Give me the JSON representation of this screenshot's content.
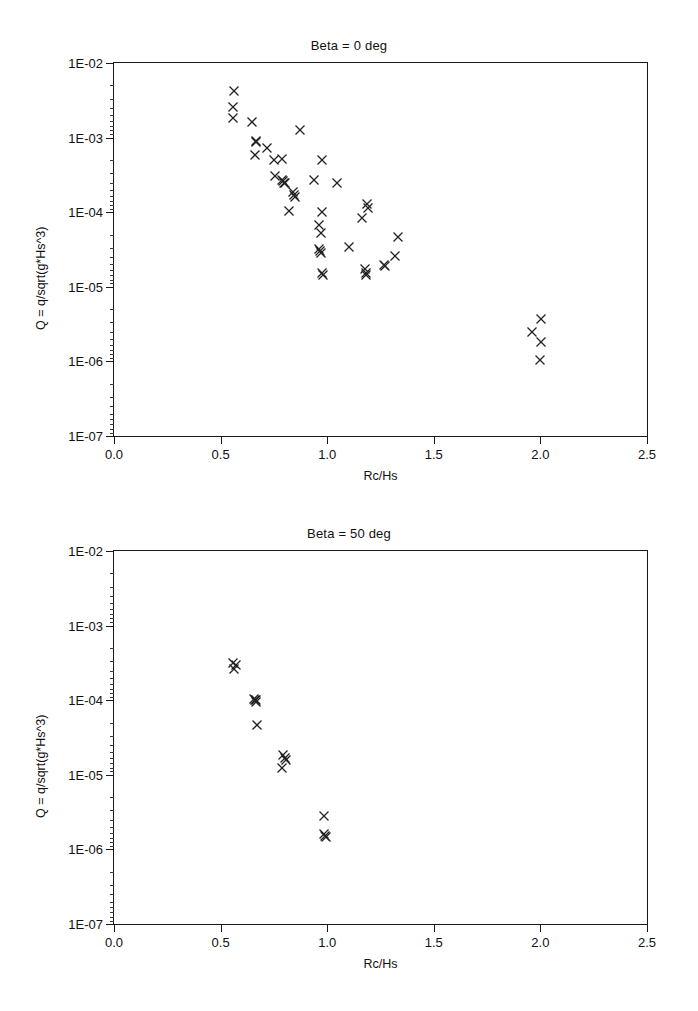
{
  "figures": [
    {
      "id": "beta-0",
      "title": "Beta = 0 deg",
      "xlabel": "Rc/Hs",
      "ylabel": "Q = q/sqrt(g*Hs^3)"
    },
    {
      "id": "beta-50",
      "title": "Beta = 50 deg",
      "xlabel": "Rc/Hs",
      "ylabel": "Q = q/sqrt(g*Hs^3)"
    }
  ],
  "axis": {
    "x_ticks": [
      "0.0",
      "0.5",
      "1.0",
      "1.5",
      "2.0",
      "2.5"
    ],
    "x_tick_values": [
      0.0,
      0.5,
      1.0,
      1.5,
      2.0,
      2.5
    ],
    "y_ticks": [
      "1E-02",
      "1E-03",
      "1E-04",
      "1E-05",
      "1E-06",
      "1E-07"
    ],
    "y_tick_values": [
      0.01,
      0.001,
      0.0001,
      1e-05,
      1e-06,
      1e-07
    ],
    "xlim": [
      0.0,
      2.5
    ],
    "ylim": [
      1e-07,
      0.01
    ],
    "yscale": "log",
    "xscale": "linear",
    "grid": false
  },
  "colors": {
    "marker": "#222222",
    "axis": "#1a1a1a",
    "background": "#ffffff"
  },
  "chart_data": [
    {
      "type": "scatter",
      "title": "Beta = 0 deg",
      "xlabel": "Rc/Hs",
      "ylabel": "Q = q/sqrt(g*Hs^3)",
      "xlim": [
        0.0,
        2.5
      ],
      "ylim": [
        1e-07,
        0.01
      ],
      "yscale": "log",
      "grid": false,
      "legend": null,
      "marker": "x",
      "points": [
        {
          "x": 0.565,
          "y": 0.0042
        },
        {
          "x": 0.56,
          "y": 0.0026
        },
        {
          "x": 0.558,
          "y": 0.00185
        },
        {
          "x": 0.645,
          "y": 0.00162
        },
        {
          "x": 0.872,
          "y": 0.00125
        },
        {
          "x": 0.668,
          "y": 0.0009
        },
        {
          "x": 0.665,
          "y": 0.00086
        },
        {
          "x": 0.718,
          "y": 0.00073
        },
        {
          "x": 0.663,
          "y": 0.00058
        },
        {
          "x": 0.752,
          "y": 0.0005
        },
        {
          "x": 0.79,
          "y": 0.00051
        },
        {
          "x": 0.975,
          "y": 0.0005
        },
        {
          "x": 0.757,
          "y": 0.00031
        },
        {
          "x": 0.788,
          "y": 0.00027
        },
        {
          "x": 0.793,
          "y": 0.00026
        },
        {
          "x": 0.797,
          "y": 0.00025
        },
        {
          "x": 0.8,
          "y": 0.000245
        },
        {
          "x": 0.94,
          "y": 0.00027
        },
        {
          "x": 1.045,
          "y": 0.00025
        },
        {
          "x": 0.838,
          "y": 0.000185
        },
        {
          "x": 0.845,
          "y": 0.000172
        },
        {
          "x": 0.85,
          "y": 0.000162
        },
        {
          "x": 0.822,
          "y": 0.000105
        },
        {
          "x": 0.975,
          "y": 0.000102
        },
        {
          "x": 1.185,
          "y": 0.00013
        },
        {
          "x": 1.19,
          "y": 0.000115
        },
        {
          "x": 1.165,
          "y": 8.3e-05
        },
        {
          "x": 0.962,
          "y": 6.7e-05
        },
        {
          "x": 0.97,
          "y": 5.3e-05
        },
        {
          "x": 1.33,
          "y": 4.6e-05
        },
        {
          "x": 0.962,
          "y": 3.2e-05
        },
        {
          "x": 0.966,
          "y": 3e-05
        },
        {
          "x": 0.97,
          "y": 2.85e-05
        },
        {
          "x": 1.1,
          "y": 3.4e-05
        },
        {
          "x": 1.32,
          "y": 2.6e-05
        },
        {
          "x": 0.975,
          "y": 1.55e-05
        },
        {
          "x": 0.98,
          "y": 1.42e-05
        },
        {
          "x": 1.175,
          "y": 1.75e-05
        },
        {
          "x": 1.18,
          "y": 1.55e-05
        },
        {
          "x": 1.183,
          "y": 1.42e-05
        },
        {
          "x": 1.265,
          "y": 1.95e-05
        },
        {
          "x": 1.272,
          "y": 1.9e-05
        },
        {
          "x": 1.96,
          "y": 2.5e-06
        },
        {
          "x": 2.005,
          "y": 3.7e-06
        },
        {
          "x": 2.005,
          "y": 1.8e-06
        },
        {
          "x": 2.0,
          "y": 1.05e-06
        }
      ]
    },
    {
      "type": "scatter",
      "title": "Beta = 50 deg",
      "xlabel": "Rc/Hs",
      "ylabel": "Q = q/sqrt(g*Hs^3)",
      "xlim": [
        0.0,
        2.5
      ],
      "ylim": [
        1e-07,
        0.01
      ],
      "yscale": "log",
      "grid": false,
      "legend": null,
      "marker": "x",
      "points": [
        {
          "x": 0.558,
          "y": 0.00032
        },
        {
          "x": 0.57,
          "y": 0.0003
        },
        {
          "x": 0.562,
          "y": 0.00026
        },
        {
          "x": 0.655,
          "y": 0.000105
        },
        {
          "x": 0.66,
          "y": 0.0001
        },
        {
          "x": 0.665,
          "y": 9.6e-05
        },
        {
          "x": 0.668,
          "y": 0.000102
        },
        {
          "x": 0.672,
          "y": 4.7e-05
        },
        {
          "x": 0.795,
          "y": 1.85e-05
        },
        {
          "x": 0.8,
          "y": 1.7e-05
        },
        {
          "x": 0.805,
          "y": 1.6e-05
        },
        {
          "x": 0.79,
          "y": 1.25e-05
        },
        {
          "x": 0.985,
          "y": 2.8e-06
        },
        {
          "x": 0.985,
          "y": 1.6e-06
        },
        {
          "x": 0.99,
          "y": 1.5e-06
        },
        {
          "x": 0.995,
          "y": 1.45e-06
        }
      ]
    }
  ]
}
